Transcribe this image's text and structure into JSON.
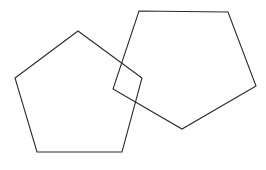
{
  "figure": {
    "title": "Two overlapping pentagons",
    "background_color": "#ffffff",
    "stroke_color": "#2b2b2b",
    "stroke_width": 1.1,
    "canvas": {
      "width": 266,
      "height": 170
    },
    "shape_count": 2,
    "shapes": [
      {
        "id": "left-pentagon",
        "name": "Left pentagon",
        "type": "pentagon",
        "sides": 5,
        "fill": "none",
        "orientation": "apex-up",
        "points": "78,31 142,78 122,152 37,152 15,78",
        "vertices": [
          {
            "label": "apex-top",
            "x": 78,
            "y": 31
          },
          {
            "label": "right",
            "x": 142,
            "y": 78
          },
          {
            "label": "bottom-right",
            "x": 122,
            "y": 152
          },
          {
            "label": "bottom-left",
            "x": 37,
            "y": 152
          },
          {
            "label": "left",
            "x": 15,
            "y": 78
          }
        ]
      },
      {
        "id": "right-pentagon",
        "name": "Right pentagon",
        "type": "pentagon",
        "sides": 5,
        "fill": "none",
        "orientation": "flat-top",
        "points": "139,11 228,12 256,86 182,129 113,89",
        "vertices": [
          {
            "label": "top-left",
            "x": 139,
            "y": 11
          },
          {
            "label": "top-right",
            "x": 228,
            "y": 12
          },
          {
            "label": "right",
            "x": 256,
            "y": 86
          },
          {
            "label": "bottom",
            "x": 182,
            "y": 129
          },
          {
            "label": "left",
            "x": 113,
            "y": 89
          }
        ]
      }
    ],
    "intersection": {
      "name": "Overlap region",
      "type": "quadrilateral",
      "corner_count": 4,
      "corners": [
        {
          "label": "top",
          "x": 121,
          "y": 61
        },
        {
          "label": "right",
          "x": 142,
          "y": 78
        },
        {
          "label": "bottom",
          "x": 124,
          "y": 98
        },
        {
          "label": "left",
          "x": 113,
          "y": 89
        }
      ]
    }
  }
}
